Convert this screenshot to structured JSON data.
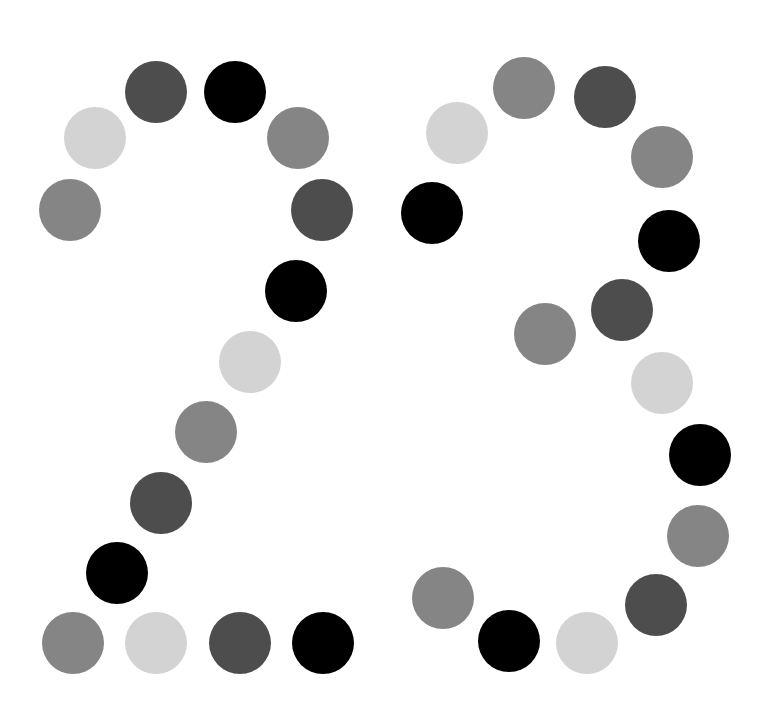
{
  "title": "23",
  "palette": {
    "light": "#d3d3d3",
    "mid": "#858585",
    "dark": "#4d4d4d",
    "black": "#000000"
  },
  "radius": 31,
  "digits": [
    {
      "char": "2",
      "dots": [
        {
          "x": 70,
          "y": 210,
          "c": "mid"
        },
        {
          "x": 95,
          "y": 138,
          "c": "light"
        },
        {
          "x": 156,
          "y": 92,
          "c": "dark"
        },
        {
          "x": 235,
          "y": 92,
          "c": "black"
        },
        {
          "x": 298,
          "y": 138,
          "c": "mid"
        },
        {
          "x": 322,
          "y": 210,
          "c": "dark"
        },
        {
          "x": 296,
          "y": 291,
          "c": "black"
        },
        {
          "x": 250,
          "y": 362,
          "c": "light"
        },
        {
          "x": 206,
          "y": 432,
          "c": "mid"
        },
        {
          "x": 161,
          "y": 503,
          "c": "dark"
        },
        {
          "x": 117,
          "y": 573,
          "c": "black"
        },
        {
          "x": 73,
          "y": 643,
          "c": "mid"
        },
        {
          "x": 156,
          "y": 643,
          "c": "light"
        },
        {
          "x": 240,
          "y": 643,
          "c": "dark"
        },
        {
          "x": 323,
          "y": 643,
          "c": "black"
        }
      ]
    },
    {
      "char": "3",
      "dots": [
        {
          "x": 432,
          "y": 213,
          "c": "black"
        },
        {
          "x": 457,
          "y": 133,
          "c": "light"
        },
        {
          "x": 524,
          "y": 88,
          "c": "mid"
        },
        {
          "x": 605,
          "y": 97,
          "c": "dark"
        },
        {
          "x": 662,
          "y": 157,
          "c": "mid"
        },
        {
          "x": 669,
          "y": 241,
          "c": "black"
        },
        {
          "x": 622,
          "y": 310,
          "c": "dark"
        },
        {
          "x": 545,
          "y": 334,
          "c": "mid"
        },
        {
          "x": 662,
          "y": 383,
          "c": "light"
        },
        {
          "x": 700,
          "y": 455,
          "c": "black"
        },
        {
          "x": 698,
          "y": 536,
          "c": "mid"
        },
        {
          "x": 656,
          "y": 605,
          "c": "dark"
        },
        {
          "x": 587,
          "y": 643,
          "c": "light"
        },
        {
          "x": 509,
          "y": 641,
          "c": "black"
        },
        {
          "x": 443,
          "y": 598,
          "c": "mid"
        }
      ]
    }
  ]
}
